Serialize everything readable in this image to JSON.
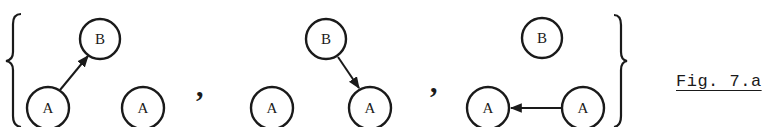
{
  "figure": {
    "caption": "Fig. 7.a",
    "set_notation": "{ G1 , G2 , G3 }",
    "separator": ","
  },
  "graphs": [
    {
      "id": "graph-1",
      "nodes": [
        {
          "label": "B",
          "cx": 100,
          "cy": 39
        },
        {
          "label": "A",
          "cx": 48,
          "cy": 108
        },
        {
          "label": "A",
          "cx": 143,
          "cy": 108
        }
      ],
      "edges": [
        {
          "from": "A (left)",
          "to": "B",
          "direction": "up-right"
        }
      ]
    },
    {
      "id": "graph-2",
      "nodes": [
        {
          "label": "B",
          "cx": 326,
          "cy": 39
        },
        {
          "label": "A",
          "cx": 272,
          "cy": 108
        },
        {
          "label": "A",
          "cx": 370,
          "cy": 108
        }
      ],
      "edges": [
        {
          "from": "B",
          "to": "A (right)",
          "direction": "down-right"
        }
      ]
    },
    {
      "id": "graph-3",
      "nodes": [
        {
          "label": "B",
          "cx": 542,
          "cy": 38
        },
        {
          "label": "A",
          "cx": 488,
          "cy": 108
        },
        {
          "label": "A",
          "cx": 583,
          "cy": 108
        }
      ],
      "edges": [
        {
          "from": "A (right)",
          "to": "A (left)",
          "direction": "left"
        }
      ]
    }
  ],
  "colors": {
    "ink": "#1a1a1a",
    "background": "#ffffff"
  }
}
